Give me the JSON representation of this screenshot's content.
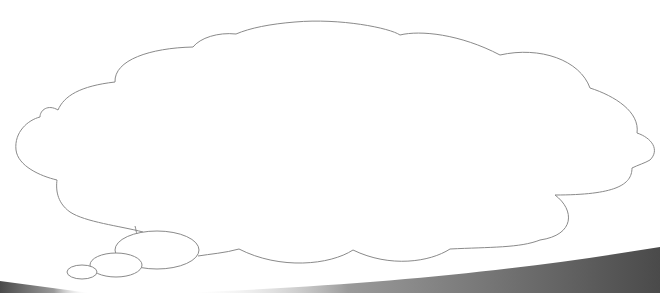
{
  "scene": {
    "label": "Empty thought bubble",
    "background_color": "#ffffff",
    "outline_color": "#8a8a8a",
    "fill_color": "#ffffff",
    "text": ""
  },
  "thought_bubble": {
    "cloud": {
      "stroke": "#8a8a8a",
      "fill": "#ffffff"
    },
    "trail_circles": [
      {
        "name": "large",
        "cx": 157,
        "cy": 250,
        "rx": 42,
        "ry": 18
      },
      {
        "name": "medium",
        "cx": 115,
        "cy": 265,
        "rx": 26,
        "ry": 12
      },
      {
        "name": "small",
        "cx": 82,
        "cy": 271,
        "rx": 15,
        "ry": 7
      }
    ]
  },
  "swoosh": {
    "color_dark": "#4a4a4a",
    "color_light": "#bdbdbd"
  }
}
